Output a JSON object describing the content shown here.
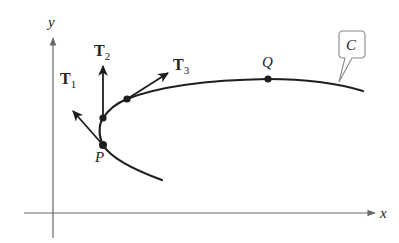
{
  "diagram": {
    "axes": {
      "x_label": "x",
      "y_label": "y"
    },
    "curve": {
      "label": "C",
      "color": "#1e1e1e"
    },
    "points": [
      {
        "id": "P",
        "label": "P"
      },
      {
        "id": "p2",
        "label": ""
      },
      {
        "id": "p3",
        "label": ""
      },
      {
        "id": "Q",
        "label": "Q"
      }
    ],
    "vectors": [
      {
        "id": "T1",
        "symbol": "T",
        "subscript": "1"
      },
      {
        "id": "T2",
        "symbol": "T",
        "subscript": "2"
      },
      {
        "id": "T3",
        "symbol": "T",
        "subscript": "3"
      }
    ]
  }
}
